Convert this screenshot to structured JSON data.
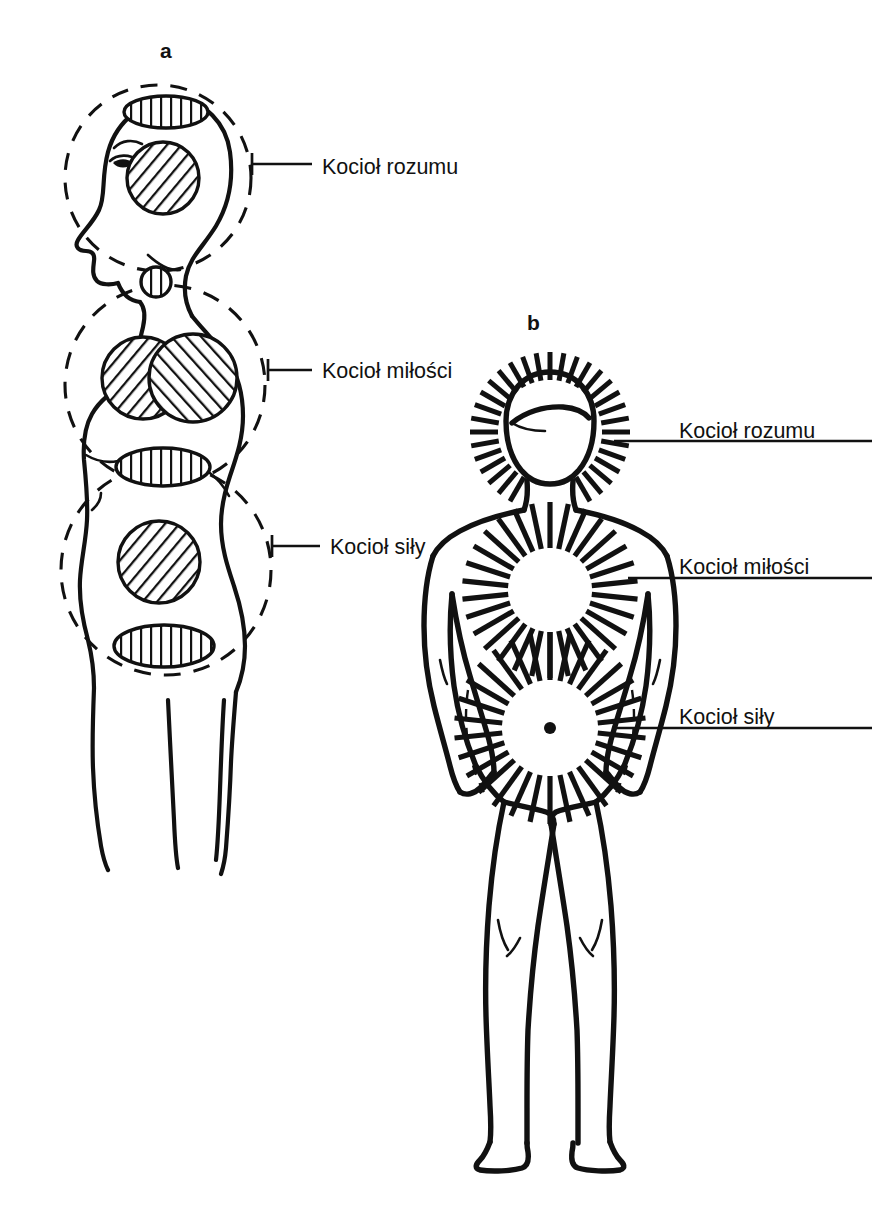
{
  "figure": {
    "title_present": false,
    "background_color": "#ffffff",
    "ink_color": "#111111",
    "panels": [
      {
        "id": "a",
        "letter": "a",
        "view": "side profile of human figure, head and torso",
        "annotations": [
          {
            "id": "a-mind",
            "label": "Kocioł rozumu",
            "region": "head"
          },
          {
            "id": "a-love",
            "label": "Kocioł miłości",
            "region": "chest"
          },
          {
            "id": "a-power",
            "label": "Kocioł siły",
            "region": "lower abdomen"
          }
        ]
      },
      {
        "id": "b",
        "letter": "b",
        "view": "front view of full human figure with radiating energy",
        "annotations": [
          {
            "id": "b-mind",
            "label": "Kocioł rozumu",
            "region": "head halo"
          },
          {
            "id": "b-love",
            "label": "Kocioł miłości",
            "region": "chest burst"
          },
          {
            "id": "b-power",
            "label": "Kocioł siły",
            "region": "navel burst"
          }
        ]
      }
    ]
  }
}
